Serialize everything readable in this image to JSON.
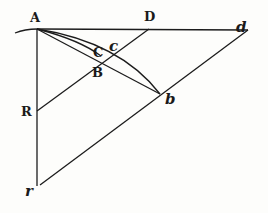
{
  "figure": {
    "type": "geometric-construction",
    "points": {
      "A": {
        "label": "A",
        "x": 37,
        "y": 29
      },
      "D": {
        "label": "D",
        "x": 149,
        "y": 29
      },
      "d": {
        "label": "d",
        "x": 248,
        "y": 30
      },
      "C": {
        "label": "C",
        "x": 101,
        "y": 55
      },
      "c": {
        "label": "c",
        "x": 115,
        "y": 50
      },
      "B": {
        "label": "B",
        "x": 100,
        "y": 63
      },
      "b": {
        "label": "b",
        "x": 160,
        "y": 94
      },
      "R": {
        "label": "R",
        "x": 37,
        "y": 111
      },
      "r": {
        "label": "r",
        "x": 37,
        "y": 186
      }
    },
    "segments": [
      "A-d",
      "A-r",
      "R-D",
      "r-d",
      "A-b",
      "arc A-b",
      "arc A-c"
    ]
  }
}
